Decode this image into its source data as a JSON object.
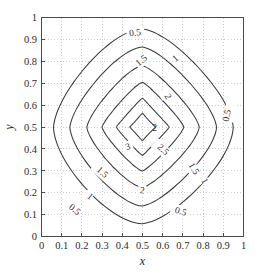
{
  "figure": {
    "background_color": "#ffffff",
    "width": 266,
    "height": 274
  },
  "axes": {
    "frame_color": "#4a4a4a",
    "grid_color": "#b9b9b9",
    "grid_visible": true,
    "x": {
      "label": "x",
      "min": 0,
      "max": 1,
      "tick_labels": [
        "0",
        "0.1",
        "0.2",
        "0.3",
        "0.4",
        "0.5",
        "0.6",
        "0.7",
        "0.8",
        "0.9",
        "1"
      ],
      "tick_values": [
        0,
        0.1,
        0.2,
        0.3,
        0.4,
        0.5,
        0.6,
        0.7,
        0.8,
        0.9,
        1
      ]
    },
    "y": {
      "label": "y",
      "min": 0,
      "max": 1,
      "tick_labels": [
        "0",
        "0.1",
        "0.2",
        "0.3",
        "0.4",
        "0.5",
        "0.6",
        "0.7",
        "0.8",
        "0.9",
        "1"
      ],
      "tick_values": [
        0,
        0.1,
        0.2,
        0.3,
        0.4,
        0.5,
        0.6,
        0.7,
        0.8,
        0.9,
        1
      ]
    }
  },
  "chart_data": {
    "type": "contour",
    "title": "",
    "xlabel": "x",
    "ylabel": "y",
    "xlim": [
      0,
      1
    ],
    "ylim": [
      0,
      1
    ],
    "grid": true,
    "legend": "none",
    "line_color": "#3a3a3a",
    "center": [
      0.5,
      0.5
    ],
    "peak_value": 3.3,
    "levels": [
      0.5,
      1,
      1.5,
      2,
      2.5,
      3
    ],
    "level_labels": [
      "0.5",
      "1",
      "1.5",
      "2",
      "2.5",
      "3"
    ],
    "contours": [
      {
        "level": 0.5,
        "label": "0.5",
        "shape": "rounded-square",
        "radius_x": 0.435,
        "radius_y": 0.435,
        "squareness": 0.62,
        "labels": [
          {
            "text": "0.5",
            "x": 0.465,
            "y": 0.932,
            "rotation": -6
          },
          {
            "text": "0.5",
            "x": 0.932,
            "y": 0.565,
            "rotation": -78
          },
          {
            "text": "0.5",
            "x": 0.155,
            "y": 0.128,
            "rotation": 40
          },
          {
            "text": "0.5",
            "x": 0.685,
            "y": 0.117,
            "rotation": 17
          }
        ]
      },
      {
        "level": 1,
        "label": "1",
        "shape": "rounded-square",
        "radius_x": 0.355,
        "radius_y": 0.355,
        "squareness": 0.52,
        "labels": [
          {
            "text": "1",
            "x": 0.672,
            "y": 0.818,
            "rotation": -40
          },
          {
            "text": "1",
            "x": 0.232,
            "y": 0.188,
            "rotation": 38
          },
          {
            "text": "1",
            "x": 0.795,
            "y": 0.262,
            "rotation": 62
          }
        ]
      },
      {
        "level": 1.5,
        "label": "1.5",
        "shape": "rounded-square",
        "radius_x": 0.272,
        "radius_y": 0.272,
        "squareness": 0.4,
        "labels": [
          {
            "text": "1.5",
            "x": 0.503,
            "y": 0.808,
            "rotation": -38
          },
          {
            "text": "1.5",
            "x": 0.292,
            "y": 0.298,
            "rotation": 42
          },
          {
            "text": "1.5",
            "x": 0.742,
            "y": 0.318,
            "rotation": 58
          }
        ]
      },
      {
        "level": 2,
        "label": "2",
        "shape": "rounded-square",
        "radius_x": 0.198,
        "radius_y": 0.198,
        "squareness": 0.26,
        "labels": [
          {
            "text": "2",
            "x": 0.613,
            "y": 0.648,
            "rotation": 62
          },
          {
            "text": "2",
            "x": 0.497,
            "y": 0.212,
            "rotation": 8
          },
          {
            "text": "2",
            "x": 0.56,
            "y": 0.498,
            "rotation": 0
          }
        ]
      },
      {
        "level": 2.5,
        "label": "2.5",
        "shape": "diamond",
        "radius_x": 0.128,
        "radius_y": 0.128,
        "squareness": 0.12,
        "labels": [
          {
            "text": "2.5",
            "x": 0.592,
            "y": 0.402,
            "rotation": 42
          }
        ]
      },
      {
        "level": 3,
        "label": "3",
        "shape": "diamond",
        "radius_x": 0.062,
        "radius_y": 0.062,
        "squareness": 0.04,
        "labels": [
          {
            "text": "3",
            "x": 0.432,
            "y": 0.412,
            "rotation": -18
          }
        ]
      }
    ]
  }
}
